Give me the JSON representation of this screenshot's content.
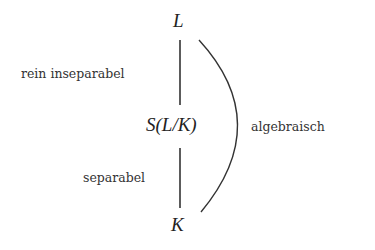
{
  "diagram": {
    "nodes": {
      "top": "L",
      "middle": "S(L/K)",
      "bottom": "K"
    },
    "edge_labels": {
      "upper": "rein inseparabel",
      "lower": "separabel",
      "arc": "algebraisch"
    },
    "colors": {
      "line": "#333333",
      "background": "#ffffff"
    }
  }
}
